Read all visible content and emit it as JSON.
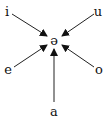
{
  "diagram": {
    "type": "vowel-reduction",
    "center": {
      "label": "ə",
      "x": 54,
      "y": 40
    },
    "nodes": [
      {
        "id": "i",
        "label": "i",
        "x": 7,
        "y": 12
      },
      {
        "id": "u",
        "label": "u",
        "x": 98,
        "y": 12
      },
      {
        "id": "e",
        "label": "e",
        "x": 8,
        "y": 70
      },
      {
        "id": "o",
        "label": "o",
        "x": 99,
        "y": 70
      },
      {
        "id": "a",
        "label": "a",
        "x": 54,
        "y": 113
      }
    ],
    "edges": [
      {
        "from": "i",
        "to": "ə"
      },
      {
        "from": "u",
        "to": "ə"
      },
      {
        "from": "e",
        "to": "ə"
      },
      {
        "from": "o",
        "to": "ə"
      },
      {
        "from": "a",
        "to": "ə"
      }
    ],
    "colors": {
      "ink": "#111111",
      "background": "#ffffff"
    }
  }
}
